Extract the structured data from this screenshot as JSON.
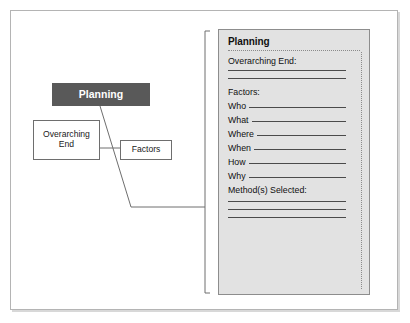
{
  "diagram": {
    "root_node": {
      "label": "Planning"
    },
    "nodes": [
      {
        "label": "Overarching\nEnd",
        "name": "node-overarching-end"
      },
      {
        "label": "Factors",
        "name": "node-factors"
      }
    ],
    "overarching_line1": "Overarching",
    "overarching_line2": "End",
    "factors_label": "Factors"
  },
  "card": {
    "title": "Planning",
    "overarching_end_label": "Overarching End:",
    "factors_label": "Factors:",
    "questions": [
      {
        "label": "Who"
      },
      {
        "label": "What"
      },
      {
        "label": "Where"
      },
      {
        "label": "When"
      },
      {
        "label": "How"
      },
      {
        "label": "Why"
      }
    ],
    "methods_label": "Method(s) Selected:"
  },
  "colors": {
    "root_node_fill": "#595959",
    "root_node_text": "#ffffff",
    "card_fill": "#e2e2e2",
    "card_border": "#8d8d8d",
    "rule": "#4a4a4a",
    "dotted": "#8a8a8a",
    "frame": "#b4b4b4",
    "connector": "#6e6e6e"
  }
}
